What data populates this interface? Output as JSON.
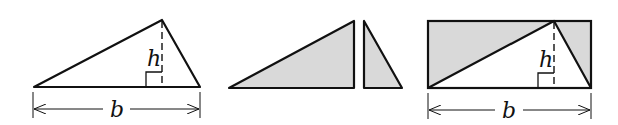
{
  "figures": [
    {
      "id": "triangle",
      "height_label": "h",
      "base_label": "b"
    },
    {
      "id": "split-triangles"
    },
    {
      "id": "triangle-in-rectangle",
      "height_label": "h",
      "base_label": "b"
    }
  ],
  "colors": {
    "stroke": "#111111",
    "fill": "#d9d9d9",
    "background": "#ffffff"
  }
}
